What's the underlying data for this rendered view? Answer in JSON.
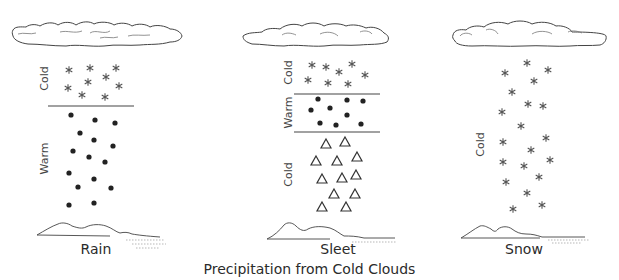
{
  "caption": "Precipitation from Cold Clouds",
  "panels": [
    {
      "name": "Rain",
      "layers": [
        {
          "label": "Cold",
          "particle": "snowflake"
        },
        {
          "label": "Warm",
          "particle": "raindrop"
        }
      ]
    },
    {
      "name": "Sleet",
      "layers": [
        {
          "label": "Cold",
          "particle": "snowflake"
        },
        {
          "label": "Warm",
          "particle": "raindrop"
        },
        {
          "label": "Cold",
          "particle": "ice-pellet"
        }
      ]
    },
    {
      "name": "Snow",
      "layers": [
        {
          "label": "Cold",
          "particle": "snowflake"
        }
      ]
    }
  ],
  "colors": {
    "ink": "#333333",
    "snow": "#555555",
    "background": "#ffffff"
  }
}
